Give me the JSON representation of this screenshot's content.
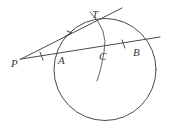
{
  "figure": {
    "background_color": "#ffffff",
    "stroke_color": "#4a4a4a",
    "width": 169,
    "height": 128
  },
  "labels": {
    "P": "P",
    "A": "A",
    "C": "C",
    "B": "B",
    "T": "T"
  },
  "points": {
    "P": {
      "x": 22,
      "y": 58
    },
    "A": {
      "x": 66,
      "y": 51
    },
    "C": {
      "x": 103,
      "y": 45
    },
    "B": {
      "x": 143,
      "y": 39
    },
    "T": {
      "x": 98,
      "y": 21
    }
  },
  "label_positions": {
    "P": {
      "x": 11,
      "y": 67
    },
    "A": {
      "x": 58,
      "y": 64
    },
    "C": {
      "x": 99,
      "y": 60
    },
    "B": {
      "x": 133,
      "y": 56
    },
    "T": {
      "x": 92,
      "y": 18
    }
  },
  "circle": {
    "cx": 105,
    "cy": 69.5,
    "r": 51
  },
  "secant_line": {
    "from": {
      "x": 20,
      "y": 59
    },
    "to": {
      "x": 160,
      "y": 37
    }
  },
  "tangent_line": {
    "from": {
      "x": 21,
      "y": 59
    },
    "to": {
      "x": 122,
      "y": 8
    }
  },
  "arc_through_T_and_C": {
    "start": {
      "x": 90,
      "y": 12
    },
    "end": {
      "x": 97,
      "y": 81
    }
  },
  "tick_marks": [
    {
      "name": "tick-on-secant-PA",
      "x": 41,
      "y": 56,
      "angle": -9
    },
    {
      "name": "tick-on-secant-CB",
      "x": 123,
      "y": 44,
      "angle": -9
    }
  ],
  "arrow_mark": {
    "name": "arrow-on-tangent",
    "x": 70,
    "y": 35,
    "angle": -27
  }
}
